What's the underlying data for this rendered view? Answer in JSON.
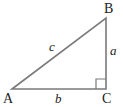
{
  "diagram": {
    "type": "right-triangle",
    "line_color": "#7a7a7a",
    "vertices": {
      "A": {
        "label": "A",
        "x": 12,
        "y": 89
      },
      "B": {
        "label": "B",
        "x": 106,
        "y": 18
      },
      "C": {
        "label": "C",
        "x": 106,
        "y": 89
      }
    },
    "sides": {
      "a": {
        "label": "a",
        "between": "B-C"
      },
      "b": {
        "label": "b",
        "between": "A-C"
      },
      "c": {
        "label": "c",
        "between": "A-B"
      }
    },
    "right_angle_at": "C"
  }
}
